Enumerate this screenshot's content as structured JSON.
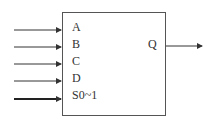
{
  "diagram": {
    "type": "multiplexer-block",
    "inputs": [
      {
        "label": "A",
        "y": 30,
        "bus": false
      },
      {
        "label": "B",
        "y": 47,
        "bus": false
      },
      {
        "label": "C",
        "y": 64,
        "bus": false
      },
      {
        "label": "D",
        "y": 81,
        "bus": false
      },
      {
        "label": "S0~1",
        "y": 99,
        "bus": true
      }
    ],
    "output": {
      "label": "Q",
      "y": 46
    },
    "colors": {
      "line": "#333333",
      "box": "#555555"
    }
  }
}
